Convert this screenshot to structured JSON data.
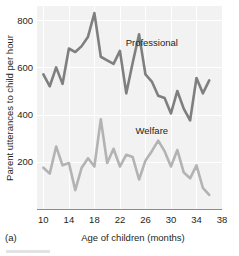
{
  "figure": {
    "panel_label": "(a)",
    "background": "#ffffff",
    "plot_background": "#f2f2f2",
    "gridline_color": "#ffffff",
    "axis_color": "#8c8c8c"
  },
  "chart_data": {
    "type": "line",
    "title": "",
    "xlabel": "Age of children (months)",
    "ylabel": "Parent utterances to child per hour",
    "xlim": [
      9,
      38
    ],
    "ylim": [
      0,
      860
    ],
    "xticks": [
      10,
      14,
      18,
      22,
      26,
      30,
      34,
      38
    ],
    "xtick_labels": [
      "10",
      "14",
      "18",
      "22",
      "26",
      "30",
      "34",
      "38"
    ],
    "yticks": [
      200,
      400,
      600,
      800
    ],
    "ytick_labels": [
      "200",
      "400",
      "600",
      "800"
    ],
    "grid": true,
    "grid_axis": "both",
    "legend_position": "inline-annotation",
    "series": [
      {
        "name": "Professional",
        "color": "#7f7f7f",
        "linewidth": 2.6,
        "label_x": 27.0,
        "label_y": 690,
        "x": [
          10,
          11,
          12,
          13,
          14,
          15,
          16,
          17,
          18,
          19,
          20,
          21,
          22,
          23,
          24,
          25,
          26,
          27,
          28,
          29,
          30,
          31,
          32,
          33,
          34,
          35,
          36
        ],
        "values": [
          570,
          520,
          600,
          530,
          680,
          665,
          690,
          730,
          830,
          645,
          630,
          615,
          670,
          490,
          620,
          740,
          570,
          540,
          480,
          470,
          405,
          500,
          425,
          375,
          555,
          490,
          545
        ]
      },
      {
        "name": "Welfare",
        "color": "#b3b3b3",
        "linewidth": 2.6,
        "label_x": 27.0,
        "label_y": 320,
        "x": [
          10,
          11,
          12,
          13,
          14,
          15,
          16,
          17,
          18,
          19,
          20,
          21,
          22,
          23,
          24,
          25,
          26,
          27,
          28,
          29,
          30,
          31,
          32,
          33,
          34,
          35,
          36
        ],
        "values": [
          175,
          150,
          265,
          185,
          195,
          80,
          175,
          215,
          180,
          380,
          195,
          255,
          180,
          230,
          220,
          125,
          205,
          245,
          290,
          245,
          180,
          250,
          155,
          130,
          185,
          90,
          60
        ]
      }
    ]
  }
}
